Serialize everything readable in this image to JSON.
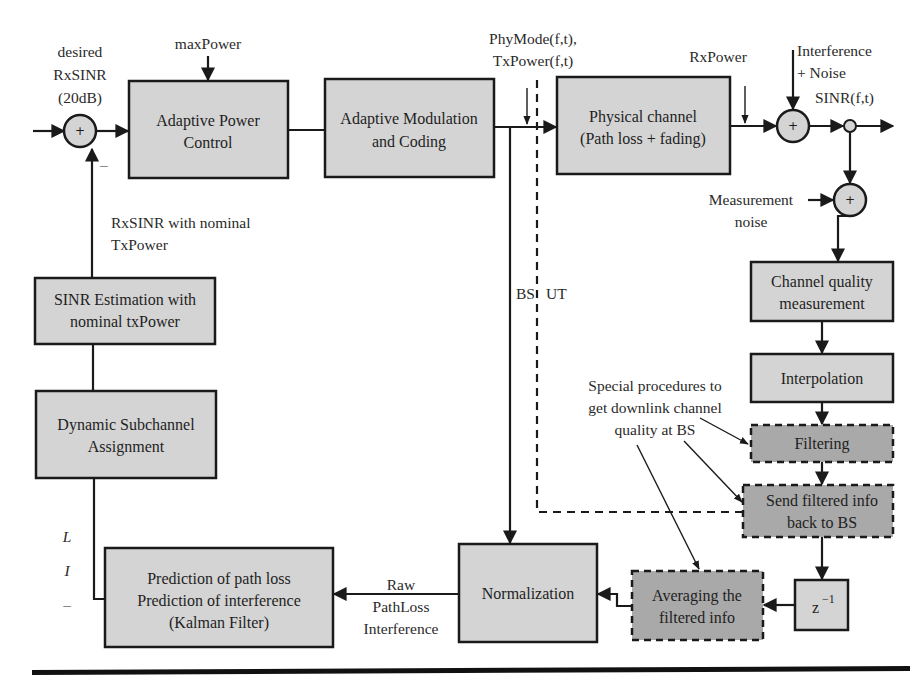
{
  "diagram": {
    "type": "block-diagram",
    "topic": "Adaptive power control loop with downlink channel quality feedback",
    "blocks": {
      "adaptive_power_control": [
        "Adaptive Power",
        "Control"
      ],
      "adaptive_modulation_coding": [
        "Adaptive Modulation",
        "and Coding"
      ],
      "physical_channel": [
        "Physical channel",
        "(Path loss + fading)"
      ],
      "channel_quality_measurement": [
        "Channel quality",
        "measurement"
      ],
      "interpolation": [
        "Interpolation"
      ],
      "filtering": [
        "Filtering"
      ],
      "send_filtered_info": [
        "Send filtered info",
        "back to BS"
      ],
      "z_inverse": {
        "base": "z",
        "exp": "−1"
      },
      "averaging_filtered_info": [
        "Averaging the",
        "filtered info"
      ],
      "normalization": [
        "Normalization"
      ],
      "prediction": [
        "Prediction of path loss",
        "Prediction of interference",
        "(Kalman Filter)"
      ],
      "sinr_estimation": [
        "SINR Estimation with",
        "nominal txPower"
      ],
      "dynamic_subchannel": [
        "Dynamic Subchannel",
        "Assignment"
      ]
    },
    "labels": {
      "desired_rxsinr": [
        "desired",
        "RxSINR",
        "(20dB)"
      ],
      "max_power": "maxPower",
      "phymode_txpower": [
        "PhyMode(f,t),",
        "TxPower(f,t)"
      ],
      "rxpower": "RxPower",
      "interference_noise": [
        "Interference",
        "+ Noise"
      ],
      "sinr_ft": "SINR(f,t)",
      "measurement_noise": [
        "Measurement",
        "noise"
      ],
      "rxsinr_nominal": [
        "RxSINR with nominal",
        "TxPower"
      ],
      "bs": "BS",
      "ut": "UT",
      "special_procedures": [
        "Special procedures to",
        "get downlink channel",
        "quality at BS"
      ],
      "raw_pathloss": [
        "Raw",
        "PathLoss",
        "Interference"
      ],
      "li_labels": [
        "L",
        "I",
        "–"
      ],
      "minus_sign": "–",
      "plus_sign": "+"
    },
    "colors": {
      "block_fill": "#d4d4d4",
      "dashed_block_fill": "#a9a9a9",
      "stroke": "#1a1a1a"
    }
  }
}
